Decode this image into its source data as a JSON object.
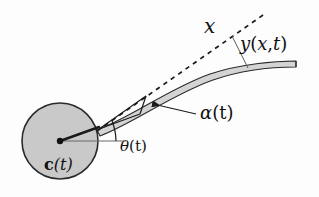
{
  "figure": {
    "background_color": "#fdfdfd",
    "ink_color": "#1a1a1a",
    "hub": {
      "name": "rigid-hub-disk",
      "fill_color": "#c9c9c9",
      "stroke_color": "#2b2b2b",
      "center_label": "c(t)",
      "center_label_parts": {
        "bold": "c",
        "rest": "(t)"
      },
      "center_x": 60,
      "center_y": 141,
      "radius": 38
    },
    "beam": {
      "name": "flexible-beam",
      "fill_color": "#d4d4d4",
      "stroke_color": "#2b2b2b",
      "label": "y(x,t)",
      "label_parts": {
        "y": "y",
        "open": "(",
        "x": "x",
        "comma": ",",
        "t": "t",
        "close": ")"
      }
    },
    "axis": {
      "name": "beam-x-axis-dashed",
      "label": "x",
      "style": "dashed",
      "stroke_color": "#1a1a1a"
    },
    "angles": [
      {
        "name": "hub-rotation-angle",
        "label": "θ(t)",
        "symbol": "θ",
        "suffix": "(t)",
        "description": "angle between horizontal reference and hub radius to beam root"
      },
      {
        "name": "beam-root-slope-angle",
        "label": "α(t)",
        "symbol": "α",
        "suffix": "(t)",
        "description": "angle between tangent x-axis and beam at its root"
      }
    ],
    "reference_line": {
      "name": "horizontal-reference-line",
      "stroke_color": "#555555"
    },
    "leader_lines": [
      {
        "name": "y-label-leader-line",
        "from_label": "y(x,t)",
        "to": "beam upper surface"
      },
      {
        "name": "alpha-label-arrow",
        "from_label": "α(t)",
        "to": "beam root angle wedge"
      }
    ]
  }
}
